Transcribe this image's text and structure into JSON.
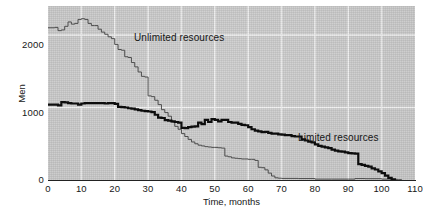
{
  "chart_data": {
    "type": "line",
    "title": "",
    "xlabel": "Time, months",
    "ylabel": "Men",
    "xlim": [
      0,
      110
    ],
    "ylim": [
      0,
      2400
    ],
    "xticks": [
      0,
      10,
      20,
      30,
      40,
      50,
      60,
      70,
      80,
      90,
      100,
      110
    ],
    "yticks": [
      0,
      1000,
      2000
    ],
    "grid": "both",
    "grid_color": "#f2f2f2",
    "plot_background": "#c9c9c9",
    "legend_position": "inline-annotations",
    "series": [
      {
        "name": "Unlimited resources",
        "style": "step",
        "color": "#4d4d4d",
        "line_width": 1,
        "points": [
          [
            0,
            2100
          ],
          [
            2,
            2105
          ],
          [
            3,
            2060
          ],
          [
            4,
            2070
          ],
          [
            5,
            2120
          ],
          [
            6,
            2180
          ],
          [
            7,
            2150
          ],
          [
            8,
            2160
          ],
          [
            9,
            2215
          ],
          [
            10,
            2225
          ],
          [
            11,
            2215
          ],
          [
            12,
            2160
          ],
          [
            13,
            2130
          ],
          [
            14,
            2130
          ],
          [
            15,
            2080
          ],
          [
            16,
            2040
          ],
          [
            17,
            2010
          ],
          [
            18,
            1975
          ],
          [
            19,
            1950
          ],
          [
            20,
            1870
          ],
          [
            21,
            1800
          ],
          [
            22,
            1790
          ],
          [
            23,
            1700
          ],
          [
            24,
            1690
          ],
          [
            25,
            1620
          ],
          [
            26,
            1560
          ],
          [
            27,
            1490
          ],
          [
            28,
            1430
          ],
          [
            29,
            1420
          ],
          [
            30,
            1160
          ],
          [
            31,
            1150
          ],
          [
            32,
            1100
          ],
          [
            33,
            1040
          ],
          [
            34,
            970
          ],
          [
            35,
            930
          ],
          [
            36,
            880
          ],
          [
            37,
            800
          ],
          [
            38,
            740
          ],
          [
            39,
            700
          ],
          [
            40,
            640
          ],
          [
            41,
            600
          ],
          [
            42,
            560
          ],
          [
            43,
            525
          ],
          [
            44,
            500
          ],
          [
            45,
            480
          ],
          [
            46,
            470
          ],
          [
            47,
            460
          ],
          [
            48,
            455
          ],
          [
            49,
            450
          ],
          [
            50,
            450
          ],
          [
            51,
            445
          ],
          [
            52,
            440
          ],
          [
            53,
            330
          ],
          [
            54,
            320
          ],
          [
            55,
            305
          ],
          [
            56,
            300
          ],
          [
            57,
            295
          ],
          [
            58,
            290
          ],
          [
            59,
            290
          ],
          [
            60,
            285
          ],
          [
            61,
            285
          ],
          [
            62,
            270
          ],
          [
            63,
            175
          ],
          [
            64,
            170
          ],
          [
            65,
            140
          ],
          [
            66,
            95
          ],
          [
            67,
            55
          ],
          [
            68,
            30
          ],
          [
            69,
            25
          ],
          [
            70,
            22
          ],
          [
            75,
            20
          ],
          [
            80,
            12
          ],
          [
            85,
            12
          ],
          [
            90,
            12
          ],
          [
            92,
            20
          ],
          [
            95,
            18
          ],
          [
            100,
            12
          ],
          [
            103,
            8
          ],
          [
            105,
            5
          ],
          [
            106,
            0
          ]
        ]
      },
      {
        "name": "Limited resources",
        "style": "step",
        "color": "#0d0d0d",
        "line_width": 2.2,
        "points": [
          [
            0,
            1040
          ],
          [
            2,
            1040
          ],
          [
            3,
            1030
          ],
          [
            4,
            1075
          ],
          [
            5,
            1070
          ],
          [
            6,
            1060
          ],
          [
            7,
            1055
          ],
          [
            8,
            1055
          ],
          [
            9,
            1040
          ],
          [
            10,
            1055
          ],
          [
            11,
            1060
          ],
          [
            12,
            1060
          ],
          [
            13,
            1060
          ],
          [
            14,
            1060
          ],
          [
            15,
            1060
          ],
          [
            16,
            1060
          ],
          [
            17,
            1055
          ],
          [
            18,
            1060
          ],
          [
            19,
            1060
          ],
          [
            20,
            1050
          ],
          [
            21,
            1010
          ],
          [
            22,
            1005
          ],
          [
            23,
            1000
          ],
          [
            24,
            990
          ],
          [
            25,
            985
          ],
          [
            26,
            975
          ],
          [
            27,
            965
          ],
          [
            28,
            955
          ],
          [
            29,
            950
          ],
          [
            30,
            945
          ],
          [
            31,
            935
          ],
          [
            32,
            900
          ],
          [
            33,
            860
          ],
          [
            34,
            855
          ],
          [
            35,
            825
          ],
          [
            36,
            820
          ],
          [
            37,
            810
          ],
          [
            38,
            800
          ],
          [
            39,
            790
          ],
          [
            40,
            720
          ],
          [
            41,
            715
          ],
          [
            42,
            730
          ],
          [
            43,
            735
          ],
          [
            44,
            740
          ],
          [
            45,
            790
          ],
          [
            46,
            770
          ],
          [
            47,
            830
          ],
          [
            48,
            800
          ],
          [
            49,
            840
          ],
          [
            50,
            830
          ],
          [
            51,
            810
          ],
          [
            52,
            830
          ],
          [
            53,
            830
          ],
          [
            54,
            800
          ],
          [
            55,
            790
          ],
          [
            56,
            790
          ],
          [
            57,
            775
          ],
          [
            58,
            760
          ],
          [
            59,
            755
          ],
          [
            60,
            730
          ],
          [
            61,
            700
          ],
          [
            62,
            680
          ],
          [
            63,
            670
          ],
          [
            64,
            660
          ],
          [
            65,
            665
          ],
          [
            66,
            650
          ],
          [
            67,
            640
          ],
          [
            68,
            640
          ],
          [
            69,
            630
          ],
          [
            70,
            625
          ],
          [
            71,
            620
          ],
          [
            72,
            620
          ],
          [
            73,
            605
          ],
          [
            74,
            600
          ],
          [
            75,
            600
          ],
          [
            76,
            560
          ],
          [
            77,
            545
          ],
          [
            78,
            530
          ],
          [
            79,
            520
          ],
          [
            80,
            490
          ],
          [
            81,
            470
          ],
          [
            82,
            460
          ],
          [
            83,
            450
          ],
          [
            84,
            440
          ],
          [
            85,
            420
          ],
          [
            86,
            405
          ],
          [
            87,
            395
          ],
          [
            88,
            390
          ],
          [
            89,
            380
          ],
          [
            90,
            370
          ],
          [
            91,
            368
          ],
          [
            92,
            365
          ],
          [
            93,
            220
          ],
          [
            94,
            210
          ],
          [
            95,
            195
          ],
          [
            96,
            185
          ],
          [
            97,
            160
          ],
          [
            98,
            145
          ],
          [
            99,
            120
          ],
          [
            100,
            95
          ],
          [
            101,
            60
          ],
          [
            102,
            30
          ],
          [
            103,
            10
          ],
          [
            104,
            0
          ]
        ]
      }
    ],
    "annotations": [
      {
        "text": "Unlimited resources",
        "x": 12,
        "y": 2300
      },
      {
        "text": "Limited resources",
        "x": 61,
        "y": 890
      }
    ]
  },
  "axis": {
    "x_label": "Time, months",
    "y_label": "Men",
    "x_ticks": [
      "0",
      "10",
      "20",
      "30",
      "40",
      "50",
      "60",
      "70",
      "80",
      "90",
      "100",
      "110"
    ],
    "y_ticks": [
      "0",
      "1000",
      "2000"
    ]
  },
  "colors": {
    "plot_bg": "#c9c9c9",
    "grid": "#f2f2f2",
    "page_bg": "#ffffff",
    "unlimited": "#4d4d4d",
    "limited": "#0d0d0d",
    "text": "#171717"
  }
}
